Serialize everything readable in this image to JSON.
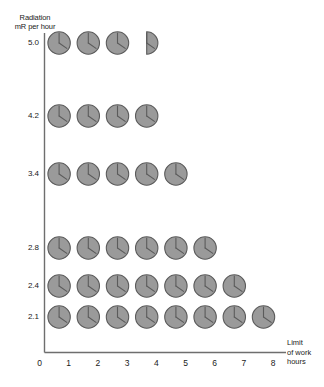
{
  "chart_data": {
    "type": "pictogram",
    "title": "",
    "ylabel": "Radiation\nmR per hour",
    "xlabel": "",
    "categories": [
      "5.0",
      "4.2",
      "3.4",
      "2.8",
      "2.4",
      "2.1"
    ],
    "values": [
      3.5,
      4,
      5,
      6,
      7,
      8
    ],
    "unit_symbol": "clock-face",
    "symbol_meaning": "one hour of work",
    "x_ticks": [
      "0",
      "1",
      "2",
      "3",
      "4",
      "5",
      "6",
      "7",
      "8"
    ],
    "xlim": [
      0,
      8
    ],
    "grid": false,
    "legend": "none",
    "annotation": "Limit\nof work\nhours",
    "series": [
      {
        "name": "Limit of work hours",
        "categories": [
          "5.0",
          "4.2",
          "3.4",
          "2.8",
          "2.4",
          "2.1"
        ],
        "values": [
          3.5,
          4,
          5,
          6,
          7,
          8
        ]
      }
    ],
    "rows": [
      {
        "radiation": "5.0",
        "hours": 3.5,
        "full_symbols": 3,
        "partial_symbol": 0.5
      },
      {
        "radiation": "4.2",
        "hours": 4,
        "full_symbols": 4,
        "partial_symbol": 0
      },
      {
        "radiation": "3.4",
        "hours": 5,
        "full_symbols": 5,
        "partial_symbol": 0
      },
      {
        "radiation": "2.8",
        "hours": 6,
        "full_symbols": 6,
        "partial_symbol": 0
      },
      {
        "radiation": "2.4",
        "hours": 7,
        "full_symbols": 7,
        "partial_symbol": 0
      },
      {
        "radiation": "2.1",
        "hours": 8,
        "full_symbols": 8,
        "partial_symbol": 0
      }
    ]
  },
  "axes": {
    "y_title": "Radiation\nmR per hour",
    "y_labels": [
      "5.0",
      "4.2",
      "3.4",
      "2.8",
      "2.4",
      "2.1"
    ],
    "x_labels": [
      "0",
      "1",
      "2",
      "3",
      "4",
      "5",
      "6",
      "7",
      "8"
    ],
    "limit_note": "Limit\nof work\nhours"
  },
  "colors": {
    "symbol_fill": "#9a9a9a",
    "symbol_stroke": "#5b5b5b",
    "axis": "#6e6e6e",
    "text": "#1a1a1a",
    "background": "#ffffff"
  }
}
